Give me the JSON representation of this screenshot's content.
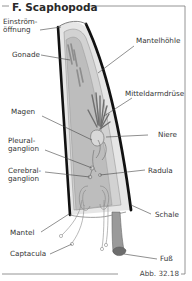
{
  "figure": {
    "title": "F. Scaphopoda",
    "caption": "Abb. 32.18",
    "colors": {
      "frame": "#7a7a7a",
      "shell_outline": "#111111",
      "shell_fill": "#e6e6e6",
      "mantle_fill": "#c8c8c8",
      "organ_dark": "#7d7d7d",
      "foot": "#9a9a9a",
      "foot_tip": "#6d6d6d",
      "leader": "#444444"
    },
    "labels": {
      "einstroem": [
        "Einström-",
        "öffnung"
      ],
      "gonade": "Gonade",
      "mantelhoehle": "Mantelhöhle",
      "mitteldarmdruese": "Mitteldarmdrüse",
      "magen": "Magen",
      "niere": "Niere",
      "pleuralganglion": [
        "Pleural-",
        "ganglion"
      ],
      "cerebralganglion": [
        "Cerebral-",
        "ganglion"
      ],
      "radula": "Radula",
      "schale": "Schale",
      "mantel": "Mantel",
      "captacula": "Captacula",
      "fuss": "Fuß"
    }
  }
}
